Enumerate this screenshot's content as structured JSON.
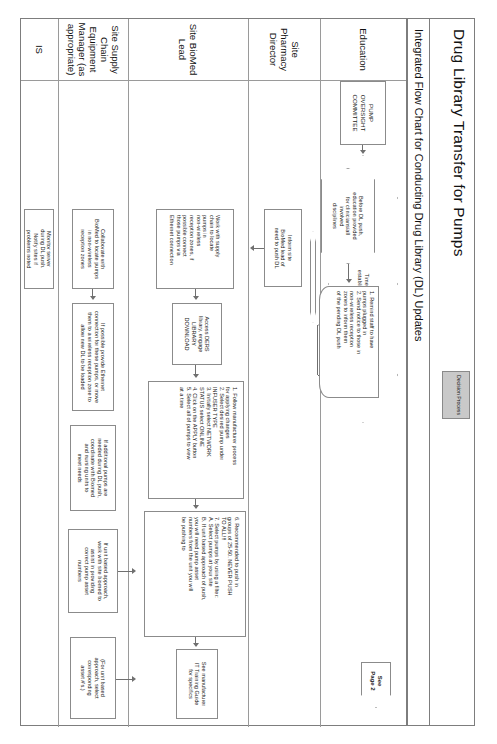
{
  "header": {
    "title": "Drug Library Transfer for Pumps",
    "decision_process_badge": "Decision\nProcess",
    "subtitle": "Integrated Flow Chart for Conducting Drug Library (DL) Updates"
  },
  "lanes": [
    {
      "id": "education",
      "label": "Education"
    },
    {
      "id": "pharmacy",
      "label": "Site Pharmacy\nDirector"
    },
    {
      "id": "biomed",
      "label": "Site BioMed\nLead"
    },
    {
      "id": "supplychain",
      "label": "Site Supply\nChain\nEquipment\nManager (as\nappropriate)"
    },
    {
      "id": "is",
      "label": "IS"
    }
  ],
  "committee": {
    "label": "PUMP\nOVERSIGHT\nCOMMITTEE"
  },
  "decisions": [
    {
      "id": "decision-push-dl",
      "label": "Decision to push\na DL finalized"
    },
    {
      "id": "decision-timeline",
      "label": "Timeline\nestablished"
    },
    {
      "id": "decision-order-of-push",
      "label": "Order of push\npredetermined per\nsite"
    }
  ],
  "education": {
    "hex": "Before DL push,\neducation provided\nfor clinicians/all\ninvolved\ndisciplines",
    "doc": "1. Remind staff to have\n    pumps plugged in\n2. Send notice to those in\n    non-wireless reception\n    zones to inform them\n    of the pending DL push"
  },
  "pharmacy": {
    "box1": "Inform site\nBioMed lead of\nneed to push DL"
  },
  "biomed": {
    "box1": "Work with supply\nchain to locate\npumps in\nnon-wireless\nreception zones, if\npossible connect\nthose pumps via\nEthernet connection",
    "box2": "Access DERS\nlibrary, engage\nLIBRARY\nDOWNLOAD",
    "list1": "1. Follow manufacturer process\n    for applying changes\n2. Select desired pump under\n    INFUSER TYPE\n3. Initially select NETWORK\n    STATUS select ONLINE\n4. Click on the APPLY button\n5. Select all of pumps to view\n    at a time",
    "list2": "6. Recommended to push in\n    groups of 25-50. NEVER PUSH\n    TO ALL!!!\n7. Select pumps by using a filter:\n    A. Select pumps at your site\n    B. If unit based approach of push,\n        you will need pump asset\n        numbers from the unit you will\n        be pushing to",
    "box3": "See manufacturer\nIT Training Guide\nfor specifics"
  },
  "supplychain": {
    "box1": "Collaborate with\nBioMed to locate pumps\nin non-wireless\nreception zones",
    "box2": "If possible provide Ethernet\nconnection for these pumps, or move\nthem to a wireless reception zone to\nallow new DL to be loaded",
    "box3": "If additional pumps are\nneeded during DL push,\ncoordinate with Biomed\nand nursing units to\nmeet needs",
    "box4": "If unit based approach,\nwork with site biomed to\nassist in providing\ncorrect pump asset\nnumbers",
    "box5": "(For unit based\napproach, select\ncorresponding\nasset #'s.)"
  },
  "is": {
    "box1": "Monitor server\nduring DL push.\nNotify sites if\nproblems noted"
  },
  "offpage": {
    "label": "See\nPage 2"
  },
  "colors": {
    "line": "#6f6f6f",
    "shape_border": "#8b8b8b",
    "badge_fill": "#c9c9c9",
    "page_bg": "#ffffff"
  }
}
